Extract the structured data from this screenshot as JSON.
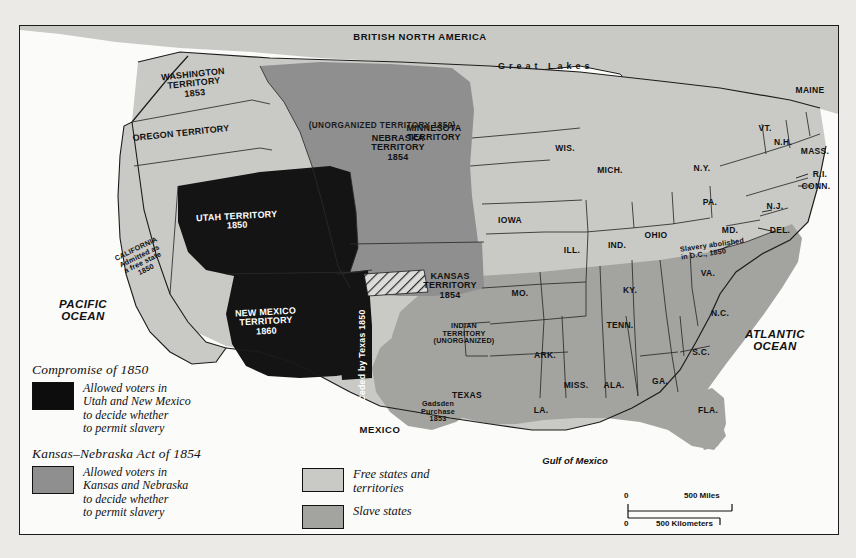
{
  "map": {
    "title_area": "Historical map of the United States 1850s",
    "countries": [
      {
        "name": "BRITISH NORTH AMERICA",
        "x": 400,
        "y": 12
      },
      {
        "name": "MEXICO",
        "x": 360,
        "y": 405
      }
    ],
    "water": [
      {
        "name": "PACIFIC\nOCEAN",
        "x": 38,
        "y": 280
      },
      {
        "name": "ATLANTIC\nOCEAN",
        "x": 712,
        "y": 310
      },
      {
        "name": "Gulf of Mexico",
        "x": 540,
        "y": 437
      },
      {
        "name": "Great Lakes",
        "x": 505,
        "y": 40
      }
    ],
    "territories": [
      {
        "name": "WASHINGTON\nTERRITORY\n1853",
        "x": 165,
        "y": 52
      },
      {
        "name": "OREGON TERRITORY",
        "x": 125,
        "y": 108
      },
      {
        "name": "UTAH TERRITORY\n1850",
        "x": 205,
        "y": 193
      },
      {
        "name": "NEW MEXICO\nTERRITORY\n1860",
        "x": 240,
        "y": 290
      },
      {
        "name": "NEBRASKA\nTERRITORY\n1854",
        "x": 373,
        "y": 115
      },
      {
        "name": "KANSAS\nTERRITORY\n1854",
        "x": 430,
        "y": 255
      },
      {
        "name": "MINNESOTA\nTERRITORY",
        "x": 414,
        "y": 105
      },
      {
        "name": "INDIAN\nTERRITORY\n(UNORGANIZED)",
        "x": 442,
        "y": 298
      },
      {
        "name": "(UNORGANIZED TERRITORY 1850)",
        "x": 285,
        "y": 78
      },
      {
        "name": "Ceded by Texas\n1850",
        "x": 340,
        "y": 310
      }
    ],
    "annotations": [
      {
        "name": "CALIFORNIA\nAdmitted as\na free state\n1850",
        "x": 115,
        "y": 228
      },
      {
        "name": "Gadsden\nPurchase\n1853",
        "x": 418,
        "y": 380
      },
      {
        "name": "Slavery abolished\nin D.C., 1850",
        "x": 700,
        "y": 220
      }
    ],
    "states": [
      {
        "label": "WIS.",
        "x": 545,
        "y": 123
      },
      {
        "label": "MICH.",
        "x": 590,
        "y": 145
      },
      {
        "label": "IOWA",
        "x": 490,
        "y": 195
      },
      {
        "label": "ILL.",
        "x": 552,
        "y": 225
      },
      {
        "label": "IND.",
        "x": 597,
        "y": 220
      },
      {
        "label": "OHIO",
        "x": 636,
        "y": 210
      },
      {
        "label": "MO.",
        "x": 500,
        "y": 268
      },
      {
        "label": "KY.",
        "x": 610,
        "y": 265
      },
      {
        "label": "TENN.",
        "x": 600,
        "y": 300
      },
      {
        "label": "ARK.",
        "x": 525,
        "y": 330
      },
      {
        "label": "MISS.",
        "x": 556,
        "y": 360
      },
      {
        "label": "ALA.",
        "x": 594,
        "y": 360
      },
      {
        "label": "GA.",
        "x": 640,
        "y": 356
      },
      {
        "label": "S.C.",
        "x": 681,
        "y": 327
      },
      {
        "label": "N.C.",
        "x": 700,
        "y": 288
      },
      {
        "label": "VA.",
        "x": 688,
        "y": 248
      },
      {
        "label": "FLA.",
        "x": 688,
        "y": 385
      },
      {
        "label": "LA.",
        "x": 521,
        "y": 385
      },
      {
        "label": "TEXAS",
        "x": 447,
        "y": 370
      },
      {
        "label": "PA.",
        "x": 690,
        "y": 177
      },
      {
        "label": "N.Y.",
        "x": 682,
        "y": 143
      },
      {
        "label": "MAINE",
        "x": 790,
        "y": 65
      },
      {
        "label": "VT.",
        "x": 745,
        "y": 103
      },
      {
        "label": "N.H.",
        "x": 763,
        "y": 117
      },
      {
        "label": "MASS.",
        "x": 795,
        "y": 126
      },
      {
        "label": "R.I.",
        "x": 800,
        "y": 149
      },
      {
        "label": "CONN.",
        "x": 796,
        "y": 161
      },
      {
        "label": "N.J.",
        "x": 755,
        "y": 181
      },
      {
        "label": "DEL.",
        "x": 760,
        "y": 205
      },
      {
        "label": "MD.",
        "x": 710,
        "y": 205
      }
    ]
  },
  "legend": {
    "block1": {
      "title": "Compromise of 1850",
      "swatch_color": "#0d0d0d",
      "description": "Allowed voters in\nUtah and New Mexico\nto decide whether\nto permit slavery"
    },
    "block2": {
      "title": "Kansas–Nebraska Act of 1854",
      "swatch_color": "#8f8f8f",
      "description": "Allowed voters in\nKansas and Nebraska\nto decide whether\nto permit slavery"
    },
    "block3": [
      {
        "label": "Free states and\nterritories",
        "swatch_color": "#c9c9c6"
      },
      {
        "label": "Slave states",
        "swatch_color": "#a3a3a0"
      }
    ]
  },
  "scale": {
    "miles_zero": "0",
    "miles_value": "500 Miles",
    "km_zero": "0",
    "km_value": "500 Kilometers"
  },
  "colors": {
    "free": "#c9c9c6",
    "slave": "#a3a3a0",
    "kn_act": "#8f8f8f",
    "compromise": "#141414",
    "water": "#fbfbf9",
    "border": "#1c1c1c",
    "page_bg": "#eceae6"
  }
}
